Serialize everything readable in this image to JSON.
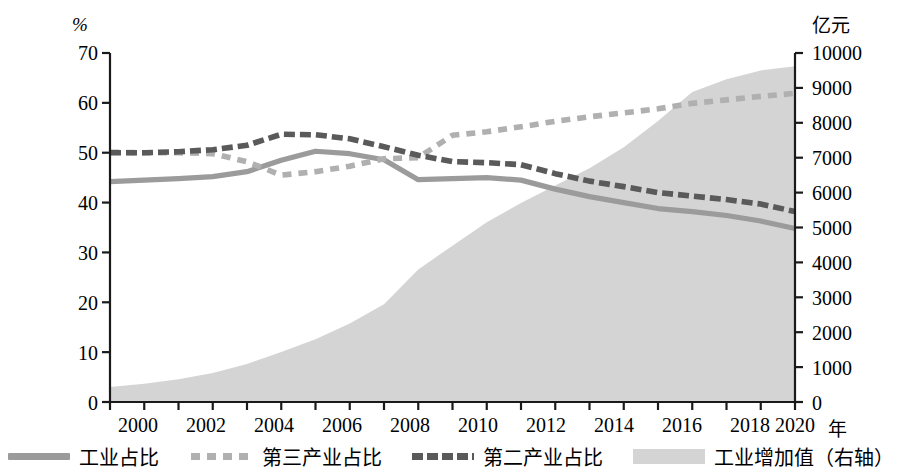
{
  "axes": {
    "left_unit": "%",
    "right_unit": "亿元",
    "x_unit": "年",
    "left_ticks": [
      "70",
      "60",
      "50",
      "40",
      "30",
      "20",
      "10",
      "0"
    ],
    "right_ticks": [
      "10000",
      "9000",
      "8000",
      "7000",
      "6000",
      "5000",
      "4000",
      "3000",
      "2000",
      "1000",
      "0"
    ],
    "x_ticks": [
      "2000",
      "2002",
      "2004",
      "2006",
      "2008",
      "2010",
      "2012",
      "2014",
      "2016",
      "2018",
      "2020"
    ]
  },
  "legend": {
    "items": [
      {
        "label": "工业占比",
        "marker": "solid-line",
        "color": "#9b9b9b"
      },
      {
        "label": "第三产业占比",
        "marker": "dashed-line-light",
        "color": "#b0b0b0"
      },
      {
        "label": "第二产业占比",
        "marker": "dashed-line-dark",
        "color": "#5a5a5a"
      },
      {
        "label": "工业增加值（右轴）",
        "marker": "area-swatch",
        "color": "#d4d4d4"
      }
    ]
  },
  "colors": {
    "industry_share": "#9b9b9b",
    "tertiary_share": "#b0b0b0",
    "secondary_share": "#5a5a5a",
    "area_fill": "#d4d4d4",
    "axis": "#1a1a1a"
  },
  "chart_data": {
    "type": "line",
    "title": "",
    "subtitle": "",
    "xlabel": "年",
    "ylabel": "%",
    "y2label": "亿元",
    "ylim": [
      0,
      70
    ],
    "y2lim": [
      0,
      10000
    ],
    "xlim": [
      2000,
      2020
    ],
    "grid": false,
    "legend_position": "bottom",
    "x": [
      2000,
      2001,
      2002,
      2003,
      2004,
      2005,
      2006,
      2007,
      2008,
      2009,
      2010,
      2011,
      2012,
      2013,
      2014,
      2015,
      2016,
      2017,
      2018,
      2019,
      2020
    ],
    "series": [
      {
        "name": "工业占比",
        "axis": "left",
        "style": "solid",
        "color": "#9b9b9b",
        "values": [
          44.2,
          44.5,
          44.8,
          45.2,
          46.2,
          48.5,
          50.3,
          49.8,
          48.6,
          44.6,
          44.8,
          45.0,
          44.5,
          42.7,
          41.2,
          40.0,
          38.8,
          38.2,
          37.4,
          36.3,
          34.8
        ]
      },
      {
        "name": "第三产业占比",
        "axis": "left",
        "style": "dashed-light",
        "color": "#b0b0b0",
        "values": [
          50.1,
          50.0,
          50.0,
          49.8,
          48.2,
          45.5,
          46.2,
          47.3,
          48.8,
          49.0,
          53.5,
          54.2,
          55.2,
          56.3,
          57.2,
          58.0,
          58.8,
          59.9,
          60.6,
          61.3,
          61.9
        ]
      },
      {
        "name": "第二产业占比",
        "axis": "left",
        "style": "dashed-dark",
        "color": "#5a5a5a",
        "values": [
          50.0,
          50.0,
          50.2,
          50.6,
          51.5,
          53.7,
          53.6,
          52.8,
          51.2,
          49.5,
          48.2,
          48.0,
          47.6,
          45.8,
          44.3,
          43.2,
          42.0,
          41.3,
          40.6,
          39.7,
          38.2
        ]
      },
      {
        "name": "工业增加值（右轴）",
        "axis": "right",
        "style": "area",
        "color": "#d4d4d4",
        "values": [
          430,
          520,
          650,
          830,
          1090,
          1430,
          1800,
          2250,
          2800,
          3800,
          4480,
          5150,
          5700,
          6200,
          6700,
          7300,
          8050,
          8880,
          9250,
          9500,
          9620
        ]
      }
    ]
  }
}
